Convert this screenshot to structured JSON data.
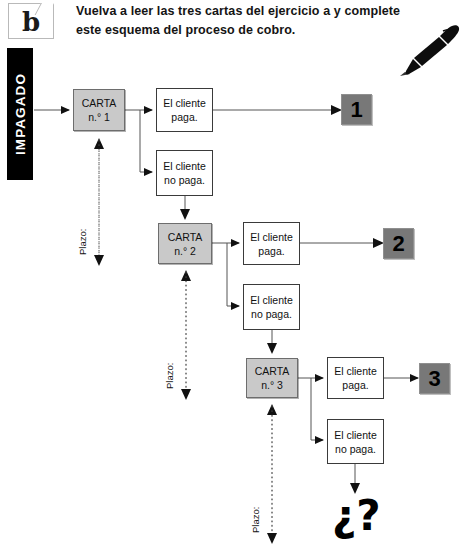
{
  "header": {
    "logo_letter": "b",
    "instruction": "Vuelva a leer las tres cartas del ejercicio a y complete este esquema del proceso de cobro.",
    "pen_icon": "fountain-pen-icon"
  },
  "banner": {
    "label": "IMPAGADO"
  },
  "flow": {
    "levels": [
      {
        "letter_label": "CARTA",
        "letter_number": "n.° 1",
        "pays_label": "El cliente paga.",
        "not_pays_label": "El cliente no paga.",
        "result": "1",
        "deadline_label": "Plazo:"
      },
      {
        "letter_label": "CARTA",
        "letter_number": "n.° 2",
        "pays_label": "El cliente paga.",
        "not_pays_label": "El cliente no paga.",
        "result": "2",
        "deadline_label": "Plazo:"
      },
      {
        "letter_label": "CARTA",
        "letter_number": "n.° 3",
        "pays_label": "El cliente paga.",
        "not_pays_label": "El cliente no paga.",
        "result": "3",
        "deadline_label": "Plazo:"
      }
    ],
    "unknown_outcome": "¿?"
  },
  "colors": {
    "letter_box_fill": "#c9c9c9",
    "letter_box_border": "#6d6d6d",
    "result_box_fill": "#787878",
    "banner_fill": "#000000",
    "text": "#111111",
    "wire": "#555555"
  }
}
